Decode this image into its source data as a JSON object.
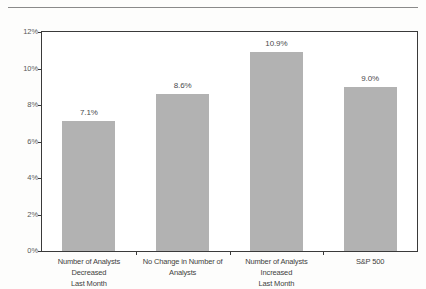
{
  "chart_data": {
    "type": "bar",
    "title": "",
    "subtitle": "",
    "xlabel": "",
    "ylabel": "",
    "ylim": [
      0,
      12
    ],
    "ytick_labels": [
      "0%",
      "2%",
      "4%",
      "6%",
      "8%",
      "10%",
      "12%"
    ],
    "ytick_values": [
      0,
      2,
      4,
      6,
      8,
      10,
      12
    ],
    "grid": false,
    "legend": false,
    "legend_position": "none",
    "bar_color": "#b2b2b2",
    "axis_color": "#3a3a3a",
    "categories": [
      "Number of Analysts Decreased Last Month",
      "No Change in Number of Analysts",
      "Number of Analysts Increased Last Month",
      "S&P 500"
    ],
    "category_lines": [
      [
        "Number of Analysts Decreased",
        "Last Month"
      ],
      [
        "No Change in Number of",
        "Analysts"
      ],
      [
        "Number of Analysts Increased",
        "Last Month"
      ],
      [
        "S&P 500",
        ""
      ]
    ],
    "values": [
      7.1,
      8.6,
      10.9,
      9.0
    ],
    "data_labels": [
      "7.1%",
      "8.6%",
      "10.9%",
      "9.0%"
    ]
  }
}
